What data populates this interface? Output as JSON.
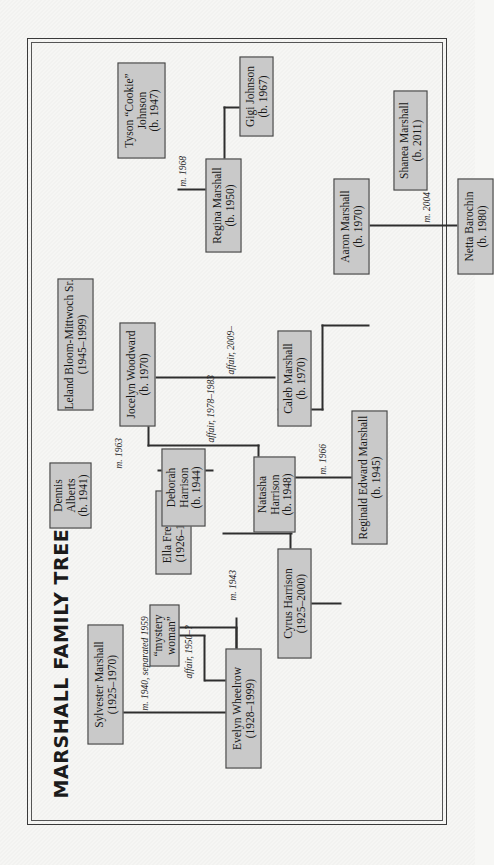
{
  "document": {
    "title": "MARSHALL FAMILY TREE",
    "frame_color": "#3a3a3a",
    "node_fill": "#c9c9c9",
    "node_border": "#3d3d3d",
    "background": "#f6f6f4"
  },
  "nodes": [
    {
      "id": "evelyn",
      "name": "Evelyn Wheelrow",
      "dates": "(1928–1999)"
    },
    {
      "id": "sylvester",
      "name": "Sylvester Marshall",
      "dates": "(1925–1970)"
    },
    {
      "id": "mystery",
      "name": "“mystery woman”",
      "dates": ""
    },
    {
      "id": "cyrus",
      "name": "Cyrus Harrison",
      "dates": "(1925–2000)"
    },
    {
      "id": "ella",
      "name": "Ella Freeman",
      "dates": "(1926–1996)"
    },
    {
      "id": "reginald",
      "name": "Reginald Edward Marshall",
      "dates": "(b. 1945)"
    },
    {
      "id": "regina",
      "name": "Regina Marshall",
      "dates": "(b. 1950)"
    },
    {
      "id": "tyson",
      "name": "Tyson “Cookie” Johnson",
      "dates": "(b. 1947)"
    },
    {
      "id": "gigi",
      "name": "Gigi Johnson",
      "dates": "(b. 1967)"
    },
    {
      "id": "natasha",
      "name": "Natasha Harrison",
      "dates": "(b. 1948)"
    },
    {
      "id": "deborah",
      "name": "Deborah Harrison",
      "dates": "(b. 1944)"
    },
    {
      "id": "dennis",
      "name": "Dennis Alberts",
      "dates": "(b. 1941)"
    },
    {
      "id": "leland",
      "name": "Leland Bloom-Mittwoch Sr.",
      "dates": "(1945–1999)"
    },
    {
      "id": "caleb",
      "name": "Caleb Marshall",
      "dates": "(b. 1970)"
    },
    {
      "id": "jocelyn",
      "name": "Jocelyn Woodward",
      "dates": "(b. 1970)"
    },
    {
      "id": "aaron",
      "name": "Aaron Marshall",
      "dates": "(b. 1970)"
    },
    {
      "id": "netta",
      "name": "Netta Barochin",
      "dates": "(b. 1980)"
    },
    {
      "id": "shanea",
      "name": "Shanea Marshall",
      "dates": "(b. 2011)"
    }
  ],
  "relationships": [
    {
      "id": "rel_syl_eve",
      "label": "m. 1940, separated 1959"
    },
    {
      "id": "rel_syl_mys",
      "label": "affair, 1950–?"
    },
    {
      "id": "rel_cyr_ell",
      "label": "m. 1943"
    },
    {
      "id": "rel_reg_nat",
      "label": "m. 1966"
    },
    {
      "id": "rel_reg_tys",
      "label": "m. 1968"
    },
    {
      "id": "rel_deb_den",
      "label": "m. 1963"
    },
    {
      "id": "rel_nat_lel",
      "label": "affair, 1978–1983"
    },
    {
      "id": "rel_cal_joc",
      "label": "affair, 2009–"
    },
    {
      "id": "rel_aar_net",
      "label": "m. 2004"
    }
  ]
}
